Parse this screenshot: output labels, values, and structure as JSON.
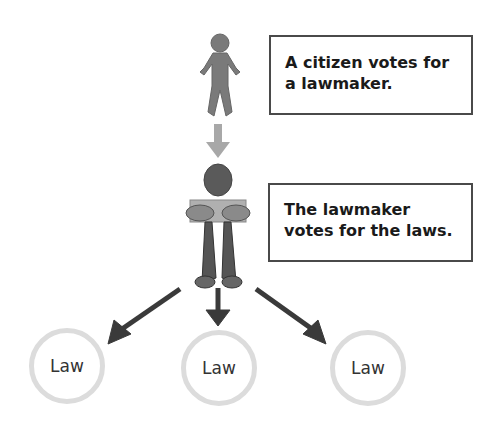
{
  "diagram": {
    "nodes": {
      "citizen": {
        "label": "A citizen votes for a lawmaker.",
        "line1": "A citizen votes for",
        "line2": "a lawmaker."
      },
      "lawmaker": {
        "label": "The lawmaker votes for the laws.",
        "line1": "The lawmaker",
        "line2": "votes for the laws."
      },
      "laws": [
        {
          "label": "Law"
        },
        {
          "label": "Law"
        },
        {
          "label": "Law"
        }
      ]
    },
    "edges": [
      {
        "from": "citizen",
        "to": "lawmaker"
      },
      {
        "from": "lawmaker",
        "to": "law-1"
      },
      {
        "from": "lawmaker",
        "to": "law-2"
      },
      {
        "from": "lawmaker",
        "to": "law-3"
      }
    ],
    "colors": {
      "citizen_arrow": "#a8a8a8",
      "law_arrows": "#3a3a3a",
      "figure": "#777777",
      "circle_border": "#dcdcdc"
    }
  }
}
